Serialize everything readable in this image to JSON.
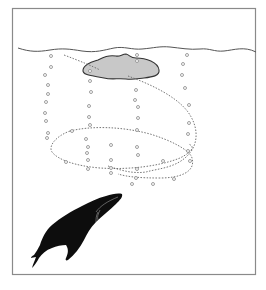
{
  "figure": {
    "elements": {
      "frame": "rectangular border",
      "water_surface": "wavy surface line",
      "prey_school": "grey shaded krill/fish school near surface",
      "bubble_net": "dotted spiral path with rising bubble columns",
      "whale": "black humpback whale silhouette ascending"
    },
    "colors": {
      "border": "#8a8a8a",
      "surface_line": "#555555",
      "prey_fill": "#c8c8c8",
      "prey_outline": "#333333",
      "bubble_outline": "#888888",
      "whale": "#0d0d0d"
    }
  }
}
